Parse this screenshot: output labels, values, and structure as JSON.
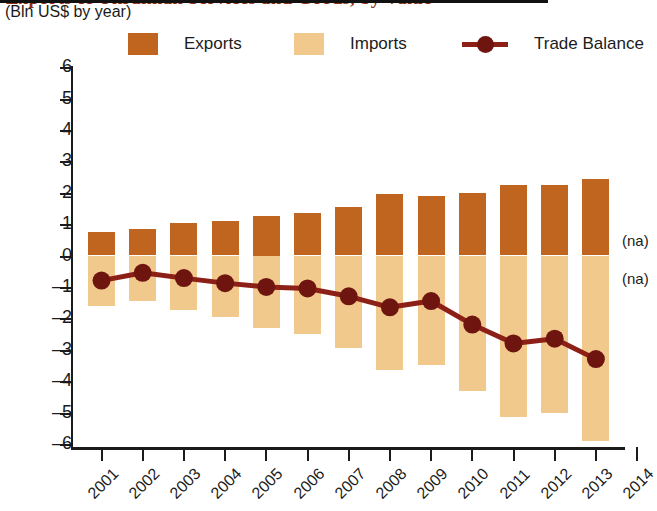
{
  "title": "Exports of Ukrainian Services and Goods, by Value",
  "subtitle": "(Bln US$ by year)",
  "legend": {
    "exports": "Exports",
    "imports": "Imports",
    "balance": "Trade Balance"
  },
  "colors": {
    "exports": "#C0651F",
    "imports": "#F2C98C",
    "balance": "#8C2017",
    "axis": "#1b1b1b",
    "title": "#8c2d12"
  },
  "annotations": {
    "na_upper": "(na)",
    "na_lower": "(na)"
  },
  "chart_data": {
    "type": "bar",
    "title": "Exports of Ukrainian Services and Goods, by Value",
    "subtitle": "(Bln US$ by year)",
    "xlabel": "",
    "ylabel": "",
    "ylim": [
      -6,
      6
    ],
    "yticks": [
      6,
      5,
      4,
      3,
      2,
      1,
      0,
      "–1",
      "–2",
      "–3",
      "–4",
      "–5",
      "–6"
    ],
    "ytick_values": [
      6,
      5,
      4,
      3,
      2,
      1,
      0,
      -1,
      -2,
      -3,
      -4,
      -5,
      -6
    ],
    "grid": false,
    "legend_position": "top",
    "categories": [
      "2001",
      "2002",
      "2003",
      "2004",
      "2005",
      "2006",
      "2007",
      "2008",
      "2009",
      "2010",
      "2011",
      "2012",
      "2013",
      "2014"
    ],
    "series": [
      {
        "name": "Exports",
        "type": "bar",
        "color": "#C0651F",
        "values": [
          0.75,
          0.85,
          1.05,
          1.1,
          1.25,
          1.35,
          1.55,
          1.95,
          1.9,
          2.0,
          2.25,
          2.25,
          2.45,
          null
        ]
      },
      {
        "name": "Imports",
        "type": "bar",
        "color": "#F2C98C",
        "values": [
          -1.6,
          -1.45,
          -1.75,
          -1.95,
          -2.3,
          -2.5,
          -2.95,
          -3.65,
          -3.5,
          -4.3,
          -5.15,
          -5.0,
          -5.9,
          null
        ]
      },
      {
        "name": "Trade Balance",
        "type": "line",
        "color": "#8C2017",
        "values": [
          -0.8,
          -0.55,
          -0.72,
          -0.88,
          -1.0,
          -1.05,
          -1.3,
          -1.65,
          -1.45,
          -2.2,
          -2.8,
          -2.65,
          -3.3,
          null
        ]
      }
    ]
  }
}
